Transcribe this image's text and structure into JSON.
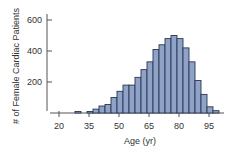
{
  "chart_data": {
    "type": "bar",
    "title": "",
    "xlabel": "Age (yr)",
    "ylabel": "# of Female Cardiac Patients",
    "x_ticks": [
      20,
      35,
      50,
      65,
      80,
      95
    ],
    "y_ticks": [
      200,
      400,
      600
    ],
    "xlim": [
      17,
      106
    ],
    "ylim": [
      0,
      650
    ],
    "bin_width": 3,
    "grid": false,
    "legend": "none",
    "categories": [
      "25",
      "28",
      "31",
      "34",
      "37",
      "40",
      "43",
      "46",
      "49",
      "52",
      "55",
      "58",
      "61",
      "64",
      "67",
      "70",
      "73",
      "76",
      "79",
      "82",
      "85",
      "88",
      "91",
      "94",
      "97"
    ],
    "bin_starts": [
      25,
      28,
      31,
      34,
      37,
      40,
      43,
      46,
      49,
      52,
      55,
      58,
      61,
      64,
      67,
      70,
      73,
      76,
      79,
      82,
      85,
      88,
      91,
      94,
      97
    ],
    "values": [
      0,
      10,
      0,
      10,
      25,
      45,
      55,
      100,
      140,
      180,
      180,
      230,
      280,
      330,
      410,
      440,
      480,
      500,
      480,
      420,
      330,
      210,
      120,
      40,
      15
    ],
    "colors": {
      "bar_fill": "#8fa3c8",
      "bar_edge": "#2b3550",
      "axis": "#555555"
    }
  }
}
